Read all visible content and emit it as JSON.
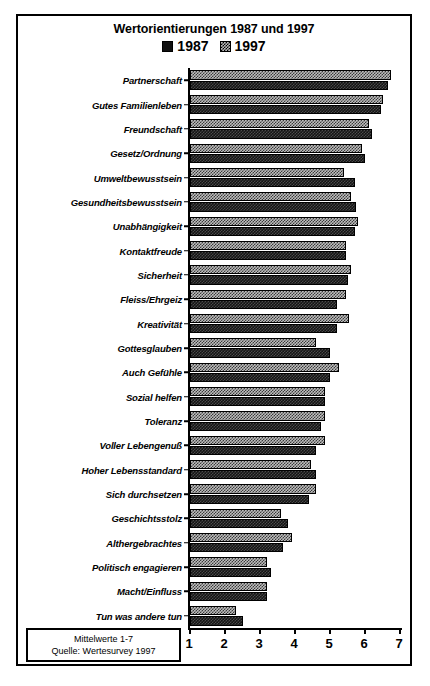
{
  "chart_data": {
    "type": "bar",
    "orientation": "horizontal",
    "title": "Wertorientierungen 1987 und 1997",
    "xlabel": "",
    "ylabel": "",
    "xlim": [
      1,
      7
    ],
    "xticks": [
      "1",
      "2",
      "3",
      "4",
      "5",
      "6",
      "7"
    ],
    "grid": false,
    "legend_position": "top-center",
    "legend": [
      "1987",
      "1997"
    ],
    "categories": [
      "Partnerschaft",
      "Gutes Familienleben",
      "Freundschaft",
      "Gesetz/Ordnung",
      "Umweltbewusstsein",
      "Gesundheitsbewusstsein",
      "Unabhängigkeit",
      "Kontaktfreude",
      "Sicherheit",
      "Fleiss/Ehrgeiz",
      "Kreativität",
      "Gottesglauben",
      "Auch Gefühle",
      "Sozial helfen",
      "Toleranz",
      "Voller Lebengenuß",
      "Hoher Lebensstandard",
      "Sich durchsetzen",
      "Geschichtsstolz",
      "Althergebrachtes",
      "Politisch engagieren",
      "Macht/Einfluss",
      "Tun was andere tun"
    ],
    "series": [
      {
        "name": "1987",
        "color": "#141414",
        "values": [
          6.65,
          6.45,
          6.2,
          6.0,
          5.7,
          5.75,
          5.7,
          5.45,
          5.5,
          5.2,
          5.2,
          5.0,
          5.0,
          4.85,
          4.75,
          4.6,
          4.6,
          4.4,
          3.8,
          3.65,
          3.3,
          3.2,
          2.5
        ]
      },
      {
        "name": "1997",
        "color": "#bdbdbd",
        "values": [
          6.75,
          6.5,
          6.1,
          5.9,
          5.4,
          5.6,
          5.8,
          5.45,
          5.6,
          5.45,
          5.55,
          4.6,
          5.25,
          4.85,
          4.85,
          4.85,
          4.45,
          4.6,
          3.6,
          3.9,
          3.2,
          3.2,
          2.3
        ]
      }
    ],
    "note_line_1": "Mittelwerte 1-7",
    "note_line_2": "Quelle: Wertesurvey 1997"
  },
  "chart": {
    "title": "Wertorientierungen 1987 und 1997"
  },
  "legend": {
    "items": [
      {
        "label": "1987",
        "swatch": "legend-swatch-1987"
      },
      {
        "label": "1997",
        "swatch": "legend-swatch-1997"
      }
    ]
  },
  "footer": {
    "line1": "Mittelwerte 1-7",
    "line2": "Quelle: Wertesurvey 1997"
  }
}
